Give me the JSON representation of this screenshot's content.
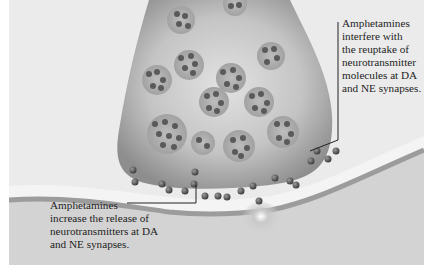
{
  "figure": {
    "colors": {
      "background": "#ebebeb",
      "terminal_fill": "#a9a9a9",
      "vesicle_fill": "#9a9a9a",
      "molecule": "#555555",
      "cleft": "#f4f4f4",
      "postsynaptic": "#cfcfcf",
      "leader_line": "#222222"
    }
  },
  "annotations": {
    "reuptake": {
      "lines": [
        "Amphetamines",
        "interfere with",
        "the reuptake of",
        "neurotransmitter",
        "molecules at DA",
        "and NE synapses."
      ]
    },
    "release": {
      "lines": [
        "Amphetamines",
        "increase the release of",
        "neurotransmitters at DA",
        "and NE synapses."
      ]
    }
  }
}
